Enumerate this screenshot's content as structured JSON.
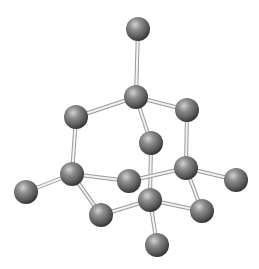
{
  "diagram": {
    "atom_radius": 12,
    "colors": {
      "background": "#ffffff",
      "atom_highlight": "#c8c8c8",
      "atom_mid": "#7a7a7a",
      "atom_shadow": "#3a3a3a",
      "bond_fill": "#f2f2f2",
      "bond_edge": "#9a9a9a"
    },
    "atoms": [
      {
        "id": "a1",
        "x": 138,
        "y": 29
      },
      {
        "id": "a2",
        "x": 136,
        "y": 97
      },
      {
        "id": "a3",
        "x": 76,
        "y": 117
      },
      {
        "id": "a4",
        "x": 187,
        "y": 110
      },
      {
        "id": "a5",
        "x": 151,
        "y": 143
      },
      {
        "id": "a6",
        "x": 72,
        "y": 174
      },
      {
        "id": "a7",
        "x": 186,
        "y": 168
      },
      {
        "id": "a8",
        "x": 26,
        "y": 192
      },
      {
        "id": "a9",
        "x": 129,
        "y": 181
      },
      {
        "id": "a10",
        "x": 236,
        "y": 180
      },
      {
        "id": "a11",
        "x": 150,
        "y": 200
      },
      {
        "id": "a12",
        "x": 101,
        "y": 215
      },
      {
        "id": "a13",
        "x": 202,
        "y": 211
      },
      {
        "id": "a14",
        "x": 157,
        "y": 245
      }
    ],
    "bonds": [
      [
        "a1",
        "a2"
      ],
      [
        "a2",
        "a3"
      ],
      [
        "a2",
        "a4"
      ],
      [
        "a2",
        "a5"
      ],
      [
        "a3",
        "a6"
      ],
      [
        "a4",
        "a7"
      ],
      [
        "a5",
        "a11"
      ],
      [
        "a6",
        "a8"
      ],
      [
        "a6",
        "a9"
      ],
      [
        "a6",
        "a12"
      ],
      [
        "a7",
        "a9"
      ],
      [
        "a7",
        "a10"
      ],
      [
        "a7",
        "a13"
      ],
      [
        "a12",
        "a11"
      ],
      [
        "a11",
        "a13"
      ],
      [
        "a11",
        "a14"
      ]
    ]
  }
}
